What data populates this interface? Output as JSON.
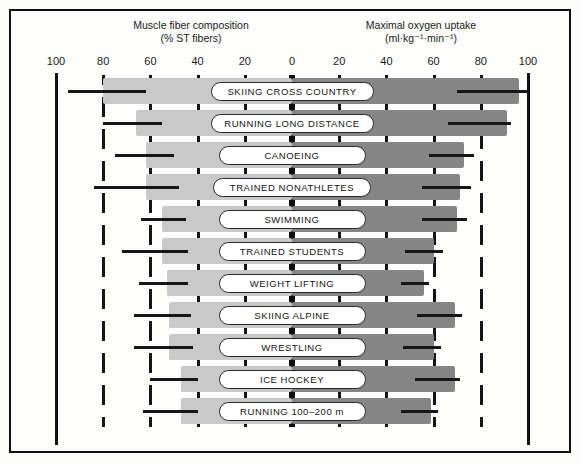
{
  "headers": {
    "left_title": "Muscle fiber composition",
    "left_subtitle": "(% ST fibers)",
    "right_title": "Maximal oxygen uptake",
    "right_subtitle": "(ml·kg⁻¹·min⁻¹)"
  },
  "axis_tick_labels": [
    "100",
    "80",
    "60",
    "40",
    "20",
    "0",
    "20",
    "40",
    "60",
    "80",
    "100"
  ],
  "colors": {
    "left_bar": "#c9c9c9",
    "right_bar": "#858585",
    "grid": "#141414",
    "frame": "#111111",
    "capsule_fill": "#ffffff",
    "text": "#141414"
  },
  "chart_data": {
    "type": "bar",
    "orientation": "horizontal-bidirectional",
    "xlabel_left": "Muscle fiber composition (% ST fibers)",
    "xlabel_right": "Maximal oxygen uptake (ml·kg⁻¹·min⁻¹)",
    "xlim_left": [
      0,
      100
    ],
    "xlim_right": [
      0,
      100
    ],
    "xticks": [
      100,
      80,
      60,
      40,
      20,
      0,
      20,
      40,
      60,
      80,
      100
    ],
    "tick_interval": 20,
    "grid": true,
    "legend": "none",
    "categories": [
      "SKIING CROSS COUNTRY",
      "RUNNING LONG DISTANCE",
      "CANOEING",
      "TRAINED NONATHLETES",
      "SWIMMING",
      "TRAINED STUDENTS",
      "WEIGHT LIFTING",
      "SKIING ALPINE",
      "WRESTLING",
      "ICE HOCKEY",
      "RUNNING 100–200 m"
    ],
    "series": [
      {
        "name": "Muscle fiber composition (% ST fibers)",
        "axis": "left",
        "units": "% ST fibers",
        "bar_extent": [
          80,
          66,
          62,
          62,
          55,
          55,
          53,
          52,
          52,
          47,
          47
        ],
        "mean": [
          72,
          61,
          58,
          56,
          50,
          52,
          50,
          49,
          49,
          45,
          45
        ],
        "range_low": [
          95,
          80,
          75,
          84,
          64,
          72,
          65,
          67,
          67,
          60,
          63
        ],
        "range_high": [
          62,
          55,
          50,
          48,
          45,
          44,
          44,
          43,
          42,
          40,
          40
        ]
      },
      {
        "name": "Maximal oxygen uptake (ml·kg⁻¹·min⁻¹)",
        "axis": "right",
        "units": "ml·kg⁻¹·min⁻¹",
        "bar_extent": [
          96,
          91,
          73,
          71,
          70,
          60,
          56,
          69,
          60,
          69,
          59
        ],
        "mean": [
          84,
          80,
          68,
          66,
          64,
          56,
          52,
          63,
          55,
          62,
          54
        ],
        "range_low": [
          70,
          66,
          58,
          55,
          55,
          48,
          46,
          53,
          47,
          52,
          46
        ],
        "range_high": [
          100,
          93,
          77,
          76,
          74,
          64,
          58,
          72,
          63,
          71,
          62
        ]
      }
    ]
  },
  "rows": [
    {
      "label": "SKIING CROSS COUNTRY",
      "left_bar": 80,
      "left_whisk_lo": 95,
      "left_whisk_hi": 62,
      "right_bar": 96,
      "right_whisk_lo": 70,
      "right_whisk_hi": 100,
      "cap_w": 163
    },
    {
      "label": "RUNNING LONG DISTANCE",
      "left_bar": 66,
      "left_whisk_lo": 80,
      "left_whisk_hi": 55,
      "right_bar": 91,
      "right_whisk_lo": 66,
      "right_whisk_hi": 93,
      "cap_w": 163
    },
    {
      "label": "CANOEING",
      "left_bar": 62,
      "left_whisk_lo": 75,
      "left_whisk_hi": 50,
      "right_bar": 73,
      "right_whisk_lo": 58,
      "right_whisk_hi": 77,
      "cap_w": 147
    },
    {
      "label": "TRAINED NONATHLETES",
      "left_bar": 62,
      "left_whisk_lo": 84,
      "left_whisk_hi": 48,
      "right_bar": 71,
      "right_whisk_lo": 55,
      "right_whisk_hi": 76,
      "cap_w": 158
    },
    {
      "label": "SWIMMING",
      "left_bar": 55,
      "left_whisk_lo": 64,
      "left_whisk_hi": 45,
      "right_bar": 70,
      "right_whisk_lo": 55,
      "right_whisk_hi": 74,
      "cap_w": 147
    },
    {
      "label": "TRAINED STUDENTS",
      "left_bar": 55,
      "left_whisk_lo": 72,
      "left_whisk_hi": 44,
      "right_bar": 60,
      "right_whisk_lo": 48,
      "right_whisk_hi": 64,
      "cap_w": 147
    },
    {
      "label": "WEIGHT LIFTING",
      "left_bar": 53,
      "left_whisk_lo": 65,
      "left_whisk_hi": 44,
      "right_bar": 56,
      "right_whisk_lo": 46,
      "right_whisk_hi": 58,
      "cap_w": 147
    },
    {
      "label": "SKIING ALPINE",
      "left_bar": 52,
      "left_whisk_lo": 67,
      "left_whisk_hi": 43,
      "right_bar": 69,
      "right_whisk_lo": 53,
      "right_whisk_hi": 72,
      "cap_w": 147
    },
    {
      "label": "WRESTLING",
      "left_bar": 52,
      "left_whisk_lo": 67,
      "left_whisk_hi": 42,
      "right_bar": 60,
      "right_whisk_lo": 47,
      "right_whisk_hi": 63,
      "cap_w": 147
    },
    {
      "label": "ICE HOCKEY",
      "left_bar": 47,
      "left_whisk_lo": 60,
      "left_whisk_hi": 40,
      "right_bar": 69,
      "right_whisk_lo": 52,
      "right_whisk_hi": 71,
      "cap_w": 147
    },
    {
      "label": "RUNNING 100–200 m",
      "left_bar": 47,
      "left_whisk_lo": 63,
      "left_whisk_hi": 40,
      "right_bar": 59,
      "right_whisk_lo": 46,
      "right_whisk_hi": 62,
      "cap_w": 147
    }
  ]
}
